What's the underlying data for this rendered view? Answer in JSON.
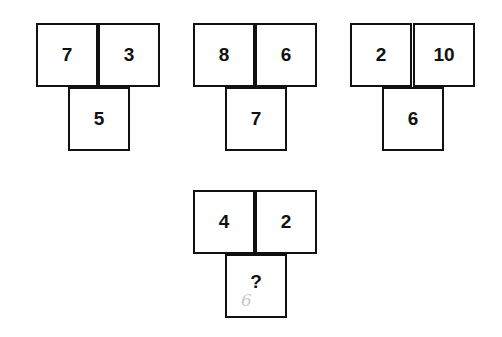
{
  "puzzle": {
    "groups": [
      {
        "left": "7",
        "right": "3",
        "bottom": "5"
      },
      {
        "left": "8",
        "right": "6",
        "bottom": "7"
      },
      {
        "left": "2",
        "right": "10",
        "bottom": "6"
      },
      {
        "left": "4",
        "right": "2",
        "bottom": "?",
        "handwritten_answer": "6"
      }
    ]
  }
}
